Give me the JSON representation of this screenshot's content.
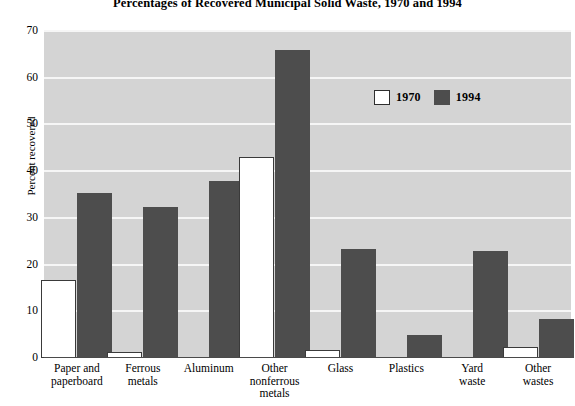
{
  "chart_data": {
    "type": "bar",
    "title": "Percentages of Recovered Municipal Solid Waste, 1970 and 1994",
    "xlabel": "",
    "ylabel": "Percent recovered",
    "ylim": [
      0,
      70
    ],
    "yticks": [
      0,
      10,
      20,
      30,
      40,
      50,
      60,
      70
    ],
    "grid": true,
    "legend_position": "upper right",
    "categories": [
      "Paper and paperboard",
      "Ferrous metals",
      "Aluminum",
      "Other nonferrous metals",
      "Glass",
      "Plastics",
      "Yard waste",
      "Other wastes"
    ],
    "category_lines": [
      [
        "Paper and",
        "paperboard"
      ],
      [
        "Ferrous",
        "metals"
      ],
      [
        "Aluminum"
      ],
      [
        "Other",
        "nonferrous",
        "metals"
      ],
      [
        "Glass"
      ],
      [
        "Plastics"
      ],
      [
        "Yard",
        "waste"
      ],
      [
        "Other",
        "wastes"
      ]
    ],
    "series": [
      {
        "name": "1970",
        "color": "#ffffff",
        "values": [
          16.8,
          1.2,
          0,
          43,
          1.8,
          0,
          0,
          2.4
        ]
      },
      {
        "name": "1994",
        "color": "#4d4d4d",
        "values": [
          35.3,
          32.4,
          37.8,
          66,
          23.4,
          4.9,
          23,
          8.3
        ]
      }
    ]
  },
  "legend": {
    "items": [
      {
        "label": "1970",
        "swatch": "white-square-swatch"
      },
      {
        "label": "1994",
        "swatch": "dark-square-swatch"
      }
    ]
  },
  "colors": {
    "plot_background": "#d4d4d4",
    "gridline": "#f6f6f6",
    "bar_1994": "#4d4d4d",
    "bar_1970": "#ffffff",
    "axis": "#4a4a4a",
    "text": "#000000"
  }
}
